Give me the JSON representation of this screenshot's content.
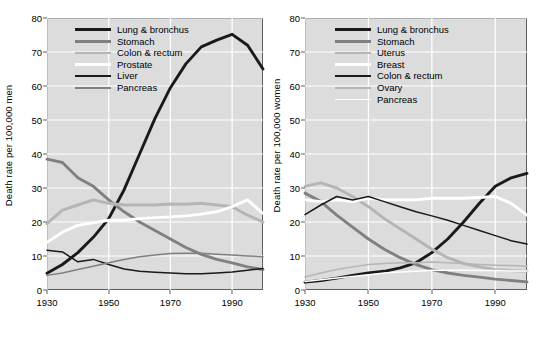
{
  "chart_data": [
    {
      "type": "line",
      "title": "",
      "panel": "men",
      "xlabel": "",
      "ylabel": "Death rate per 100,000 men",
      "xlim": [
        1930,
        2000
      ],
      "ylim": [
        0,
        80
      ],
      "xticks": [
        1930,
        1950,
        1970,
        1990
      ],
      "yticks": [
        0,
        10,
        20,
        30,
        40,
        50,
        60,
        70,
        80
      ],
      "grid": true,
      "legend_position": "top-left-inside",
      "x": [
        1930,
        1935,
        1940,
        1945,
        1950,
        1955,
        1960,
        1965,
        1970,
        1975,
        1980,
        1985,
        1990,
        1995,
        2000
      ],
      "series": [
        {
          "name": "Lung & bronchus",
          "color": "#1a1a1a",
          "width": 2.9,
          "values": [
            4.9,
            7.5,
            11.0,
            15.5,
            21.0,
            29.5,
            40.0,
            50.5,
            59.5,
            66.5,
            71.5,
            73.5,
            75.2,
            72.0,
            65.0
          ]
        },
        {
          "name": "Stomach",
          "color": "#808080",
          "width": 2.9,
          "values": [
            38.5,
            37.5,
            33.0,
            30.5,
            26.5,
            23.0,
            20.0,
            17.5,
            15.0,
            12.5,
            10.5,
            9.0,
            8.0,
            6.8,
            6.0
          ]
        },
        {
          "name": "Colon & rectum",
          "color": "#b5b5b5",
          "width": 2.9,
          "values": [
            19.5,
            23.5,
            25.0,
            26.5,
            25.5,
            25.0,
            25.0,
            25.0,
            25.3,
            25.2,
            25.5,
            25.0,
            24.5,
            22.0,
            20.0
          ]
        },
        {
          "name": "Prostate",
          "color": "#ffffff",
          "width": 2.9,
          "values": [
            14.0,
            17.0,
            19.0,
            19.8,
            20.5,
            20.5,
            21.0,
            21.3,
            21.5,
            21.8,
            22.3,
            23.0,
            24.5,
            26.5,
            22.5
          ]
        },
        {
          "name": "Liver",
          "color": "#1a1a1a",
          "width": 1.5,
          "values": [
            11.7,
            11.2,
            8.3,
            9.0,
            7.5,
            6.2,
            5.5,
            5.2,
            5.0,
            4.8,
            4.8,
            5.0,
            5.3,
            5.8,
            6.3
          ]
        },
        {
          "name": "Pancreas",
          "color": "#808080",
          "width": 1.5,
          "values": [
            4.3,
            5.0,
            6.0,
            7.0,
            8.0,
            9.0,
            9.8,
            10.3,
            10.7,
            10.8,
            10.8,
            10.5,
            10.3,
            10.0,
            9.8
          ]
        }
      ]
    },
    {
      "type": "line",
      "title": "",
      "panel": "women",
      "xlabel": "",
      "ylabel": "Death rate per 100,000 women",
      "xlim": [
        1930,
        2000
      ],
      "ylim": [
        0,
        80
      ],
      "xticks": [
        1930,
        1950,
        1970,
        1990
      ],
      "yticks": [
        0,
        10,
        20,
        30,
        40,
        50,
        60,
        70,
        80
      ],
      "grid": true,
      "legend_position": "top-left-inside",
      "x": [
        1930,
        1935,
        1940,
        1945,
        1950,
        1955,
        1960,
        1965,
        1970,
        1975,
        1980,
        1985,
        1990,
        1995,
        2000
      ],
      "series": [
        {
          "name": "Lung & bronchus",
          "color": "#1a1a1a",
          "width": 2.9,
          "values": [
            2.3,
            2.8,
            3.5,
            4.3,
            5.0,
            5.5,
            6.5,
            8.0,
            11.0,
            15.0,
            20.0,
            25.5,
            30.5,
            33.0,
            34.3
          ]
        },
        {
          "name": "Stomach",
          "color": "#808080",
          "width": 2.9,
          "values": [
            28.5,
            26.0,
            22.0,
            18.5,
            15.0,
            12.0,
            9.5,
            7.5,
            6.0,
            5.0,
            4.3,
            3.8,
            3.2,
            2.8,
            2.4
          ]
        },
        {
          "name": "Uterus",
          "color": "#b5b5b5",
          "width": 2.9,
          "values": [
            30.5,
            31.5,
            30.0,
            27.5,
            24.5,
            21.0,
            18.0,
            15.0,
            12.0,
            9.5,
            7.8,
            6.8,
            6.0,
            5.7,
            5.5
          ]
        },
        {
          "name": "Breast",
          "color": "#ffffff",
          "width": 2.9,
          "values": [
            26.5,
            26.0,
            26.5,
            26.0,
            27.0,
            26.5,
            26.5,
            26.5,
            27.0,
            27.0,
            27.0,
            27.2,
            27.5,
            25.5,
            22.0
          ]
        },
        {
          "name": "Colon & rectum",
          "color": "#1a1a1a",
          "width": 1.5,
          "values": [
            22.2,
            25.0,
            27.5,
            26.5,
            27.5,
            26.0,
            24.5,
            23.0,
            21.8,
            20.5,
            19.0,
            17.5,
            16.0,
            14.5,
            13.5
          ]
        },
        {
          "name": "Ovary",
          "color": "#b5b5b5",
          "width": 1.5,
          "values": [
            3.8,
            5.0,
            6.0,
            6.8,
            7.5,
            7.8,
            8.0,
            8.0,
            8.2,
            8.0,
            7.8,
            7.5,
            7.3,
            7.2,
            7.0
          ]
        },
        {
          "name": "Pancreas",
          "color": "#ffffff",
          "width": 1.5,
          "values": [
            2.5,
            3.0,
            3.5,
            4.0,
            4.5,
            5.0,
            5.3,
            5.5,
            5.8,
            5.8,
            5.8,
            5.7,
            5.7,
            5.6,
            5.6
          ]
        }
      ]
    }
  ],
  "panels": [
    {
      "ylabel": "Death rate per 100,000 men",
      "yticks": [
        "0",
        "10",
        "20",
        "30",
        "40",
        "50",
        "60",
        "70",
        "80"
      ],
      "xticks": [
        "1930",
        "1950",
        "1970",
        "1990"
      ],
      "legend": [
        {
          "label": "Lung & bronchus"
        },
        {
          "label": "Stomach"
        },
        {
          "label": "Colon & rectum"
        },
        {
          "label": "Prostate"
        },
        {
          "label": "Liver"
        },
        {
          "label": "Pancreas"
        }
      ]
    },
    {
      "ylabel": "Death rate per 100,000 women",
      "yticks": [
        "0",
        "10",
        "20",
        "30",
        "40",
        "50",
        "60",
        "70",
        "80"
      ],
      "xticks": [
        "1930",
        "1950",
        "1970",
        "1990"
      ],
      "legend": [
        {
          "label": "Lung & bronchus"
        },
        {
          "label": "Stomach"
        },
        {
          "label": "Uterus"
        },
        {
          "label": "Breast"
        },
        {
          "label": "Colon & rectum"
        },
        {
          "label": "Ovary"
        },
        {
          "label": "Pancreas"
        }
      ]
    }
  ],
  "colors": {
    "plot_background": "#dcdcdc",
    "grid": "#ffffff",
    "axis": "#5b5f66",
    "page_background": "#ffffff",
    "black_series": "#1a1a1a",
    "gray_series": "#808080",
    "light_gray_series": "#b5b5b5",
    "white_series": "#ffffff"
  }
}
